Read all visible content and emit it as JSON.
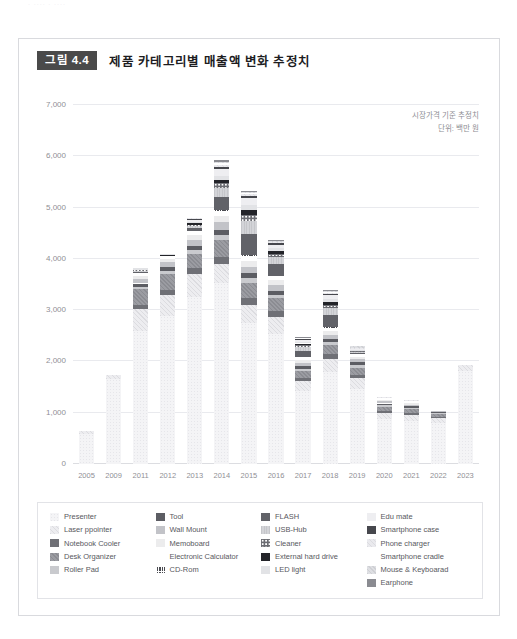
{
  "scan_artifact": "· ···· · ····",
  "figure": {
    "badge": "그림 4.4",
    "title": "제품 카테고리별 매출액 변화 추정치",
    "note_line1": "시장가격 기준 추정치",
    "note_line2": "단위: 백만 원"
  },
  "legend": {
    "columns": [
      {
        "items": [
          {
            "label": "Presenter",
            "key": "presenter"
          },
          {
            "label": "Laser ppointer",
            "key": "laser_pointer"
          },
          {
            "label": "Notebook Cooler",
            "key": "notebook_cooler"
          },
          {
            "label": "Desk Organizer",
            "key": "desk_organizer"
          },
          {
            "label": "Roller Pad",
            "key": "roller_pad"
          }
        ]
      },
      {
        "items": [
          {
            "label": "Tool",
            "key": "tool"
          },
          {
            "label": "Wall Mount",
            "key": "wall_mount"
          },
          {
            "label": "Memoboard",
            "key": "memoboard"
          },
          {
            "label": "Electronic Calculator",
            "key": "electronic_calculator"
          },
          {
            "label": "CD-Rom",
            "key": "cd_rom"
          }
        ]
      },
      {
        "items": [
          {
            "label": "FLASH",
            "key": "flash"
          },
          {
            "label": "USB-Hub",
            "key": "usb_hub"
          },
          {
            "label": "Cleaner",
            "key": "cleaner"
          },
          {
            "label": "External hard drive",
            "key": "external_hard_drive"
          },
          {
            "label": "LED light",
            "key": "led_light"
          }
        ]
      },
      {
        "items": [
          {
            "label": "Edu mate",
            "key": "edu_mate"
          },
          {
            "label": "Smartphone case",
            "key": "smartphone_case"
          },
          {
            "label": "Phone charger",
            "key": "phone_charger"
          },
          {
            "label": "Smartphone cradle",
            "key": "smartphone_cradle"
          },
          {
            "label": "Mouse & Keyboarad",
            "key": "mouse_keyboard"
          },
          {
            "label": "Earphone",
            "key": "earphone"
          }
        ]
      }
    ]
  },
  "series_styles": {
    "presenter": {
      "fill": "#f4f4f6",
      "pattern": "dots-light",
      "stroke": "#e6e6ea"
    },
    "laser_pointer": {
      "fill": "#ededf0",
      "pattern": "diag-light",
      "stroke": "#dcdce0"
    },
    "notebook_cooler": {
      "fill": "#6f7076",
      "pattern": "solid",
      "stroke": "#63646a"
    },
    "desk_organizer": {
      "fill": "#9b9ca2",
      "pattern": "diag-mid",
      "stroke": "#8b8c92"
    },
    "roller_pad": {
      "fill": "#c9cace",
      "pattern": "solid",
      "stroke": "#bcbdc2"
    },
    "tool": {
      "fill": "#5c5d63",
      "pattern": "solid",
      "stroke": "#4f5056"
    },
    "wall_mount": {
      "fill": "#c2c3c8",
      "pattern": "solid",
      "stroke": "#b4b5ba"
    },
    "memoboard": {
      "fill": "#ececed",
      "pattern": "solid",
      "stroke": "#dedee0"
    },
    "electronic_calculator": {
      "fill": "#ffffff",
      "pattern": "solid",
      "stroke": "#e4e4e8"
    },
    "cd_rom": {
      "fill": "#4a4b51",
      "pattern": "grid-dark",
      "stroke": "#3e3f45"
    },
    "flash": {
      "fill": "#616268",
      "pattern": "solid",
      "stroke": "#55565c"
    },
    "usb_hub": {
      "fill": "#d3d4d8",
      "pattern": "vlines",
      "stroke": "#c5c6ca"
    },
    "cleaner": {
      "fill": "#6b6c72",
      "pattern": "circles",
      "stroke": "#5f6066"
    },
    "external_hard_drive": {
      "fill": "#232429",
      "pattern": "solid",
      "stroke": "#1c1d22"
    },
    "led_light": {
      "fill": "#e2e3e6",
      "pattern": "solid",
      "stroke": "#d4d5d8"
    },
    "edu_mate": {
      "fill": "#eeeef1",
      "pattern": "solid",
      "stroke": "#e0e0e3"
    },
    "smartphone_case": {
      "fill": "#46474d",
      "pattern": "solid",
      "stroke": "#3a3b41"
    },
    "phone_charger": {
      "fill": "#eaeaee",
      "pattern": "diag-light",
      "stroke": "#dcdce0"
    },
    "smartphone_cradle": {
      "fill": "#ffffff",
      "pattern": "solid",
      "stroke": "#e6e6ea"
    },
    "mouse_keyboard": {
      "fill": "#dedfe3",
      "pattern": "diag-mid",
      "stroke": "#cfd0d4"
    },
    "earphone": {
      "fill": "#8a8b91",
      "pattern": "solid",
      "stroke": "#7c7d83"
    }
  },
  "chart_data": {
    "type": "bar",
    "subtype": "stacked",
    "title": "제품 카테고리별 매출액 변화 추정치",
    "subtitle": "시장가격 기준 추정치",
    "xlabel": "",
    "ylabel": "단위: 백만 원",
    "ylim": [
      0,
      7000
    ],
    "ytick_values": [
      0,
      1000,
      2000,
      3000,
      4000,
      5000,
      6000,
      7000
    ],
    "ytick_labels": [
      "0",
      "1,000",
      "2,000",
      "3,000",
      "4,000",
      "5,000",
      "6,000",
      "7,000"
    ],
    "grid": true,
    "legend_position": "bottom",
    "categories": [
      "2005",
      "2009",
      "2011",
      "2012",
      "2013",
      "2014",
      "2015",
      "2016",
      "2017",
      "2018",
      "2019",
      "2020",
      "2021",
      "2022",
      "2023"
    ],
    "totals": [
      640,
      1740,
      3800,
      4080,
      4700,
      5780,
      5160,
      4200,
      2360,
      3220,
      2280,
      1300,
      1240,
      1040,
      1930
    ],
    "series": [
      {
        "name": "Presenter",
        "key": "presenter",
        "values": [
          590,
          1660,
          2590,
          2890,
          3250,
          3520,
          2740,
          2540,
          1420,
          1790,
          1470,
          870,
          840,
          790,
          1810
        ]
      },
      {
        "name": "Laser ppointer",
        "key": "laser_pointer",
        "values": [
          50,
          80,
          430,
          400,
          460,
          380,
          360,
          330,
          190,
          260,
          200,
          120,
          110,
          100,
          120
        ]
      },
      {
        "name": "Notebook Cooler",
        "key": "notebook_cooler",
        "values": [
          0,
          0,
          90,
          110,
          120,
          140,
          130,
          110,
          70,
          90,
          70,
          40,
          40,
          30,
          0
        ]
      },
      {
        "name": "Desk Organizer",
        "key": "desk_organizer",
        "values": [
          0,
          0,
          300,
          300,
          260,
          330,
          300,
          250,
          140,
          180,
          140,
          90,
          80,
          60,
          0
        ]
      },
      {
        "name": "Roller Pad",
        "key": "roller_pad",
        "values": [
          0,
          0,
          50,
          70,
          80,
          90,
          90,
          70,
          40,
          60,
          50,
          30,
          30,
          20,
          0
        ]
      },
      {
        "name": "Tool",
        "key": "tool",
        "values": [
          0,
          0,
          60,
          70,
          90,
          110,
          100,
          80,
          50,
          60,
          50,
          30,
          30,
          20,
          0
        ]
      },
      {
        "name": "Wall Mount",
        "key": "wall_mount",
        "values": [
          0,
          0,
          80,
          90,
          110,
          140,
          130,
          110,
          60,
          80,
          60,
          40,
          30,
          20,
          0
        ]
      },
      {
        "name": "Memoboard",
        "key": "memoboard",
        "values": [
          0,
          0,
          60,
          70,
          90,
          120,
          110,
          90,
          50,
          70,
          50,
          30,
          30,
          0,
          0
        ]
      },
      {
        "name": "Electronic Calculator",
        "key": "electronic_calculator",
        "values": [
          0,
          0,
          40,
          40,
          60,
          80,
          70,
          60,
          40,
          50,
          40,
          20,
          20,
          0,
          0
        ]
      },
      {
        "name": "CD-Rom",
        "key": "cd_rom",
        "values": [
          0,
          0,
          20,
          20,
          30,
          40,
          40,
          30,
          20,
          30,
          20,
          10,
          10,
          0,
          0
        ]
      },
      {
        "name": "FLASH",
        "key": "flash",
        "values": [
          0,
          0,
          20,
          0,
          60,
          250,
          420,
          230,
          120,
          230,
          20,
          0,
          0,
          0,
          0
        ]
      },
      {
        "name": "USB-Hub",
        "key": "usb_hub",
        "values": [
          0,
          0,
          30,
          0,
          40,
          180,
          240,
          130,
          80,
          140,
          20,
          0,
          0,
          0,
          0
        ]
      },
      {
        "name": "Cleaner",
        "key": "cleaner",
        "values": [
          0,
          0,
          10,
          0,
          20,
          90,
          130,
          70,
          40,
          70,
          10,
          0,
          0,
          0,
          0
        ]
      },
      {
        "name": "External hard drive",
        "key": "external_hard_drive",
        "values": [
          0,
          0,
          10,
          10,
          20,
          60,
          90,
          50,
          30,
          50,
          10,
          0,
          0,
          0,
          0
        ]
      },
      {
        "name": "LED light",
        "key": "led_light",
        "values": [
          0,
          0,
          10,
          10,
          20,
          80,
          110,
          60,
          30,
          60,
          10,
          0,
          0,
          0,
          0
        ]
      },
      {
        "name": "Edu mate",
        "key": "edu_mate",
        "values": [
          0,
          0,
          0,
          0,
          40,
          140,
          130,
          70,
          40,
          70,
          20,
          0,
          0,
          0,
          0
        ]
      },
      {
        "name": "Smartphone case",
        "key": "smartphone_case",
        "values": [
          0,
          0,
          0,
          0,
          20,
          50,
          40,
          20,
          10,
          30,
          10,
          10,
          10,
          0,
          0
        ]
      },
      {
        "name": "Phone charger",
        "key": "phone_charger",
        "values": [
          0,
          0,
          0,
          0,
          20,
          40,
          30,
          20,
          10,
          20,
          10,
          10,
          10,
          0,
          0
        ]
      },
      {
        "name": "Smartphone cradle",
        "key": "smartphone_cradle",
        "values": [
          0,
          0,
          0,
          0,
          10,
          30,
          20,
          10,
          10,
          20,
          10,
          0,
          0,
          0,
          0
        ]
      },
      {
        "name": "Mouse & Keyboarad",
        "key": "mouse_keyboard",
        "values": [
          0,
          0,
          0,
          0,
          0,
          20,
          20,
          10,
          10,
          10,
          10,
          0,
          0,
          0,
          0
        ]
      },
      {
        "name": "Earphone",
        "key": "earphone",
        "values": [
          0,
          0,
          0,
          0,
          0,
          30,
          20,
          10,
          10,
          20,
          0,
          0,
          0,
          0,
          0
        ]
      }
    ]
  }
}
